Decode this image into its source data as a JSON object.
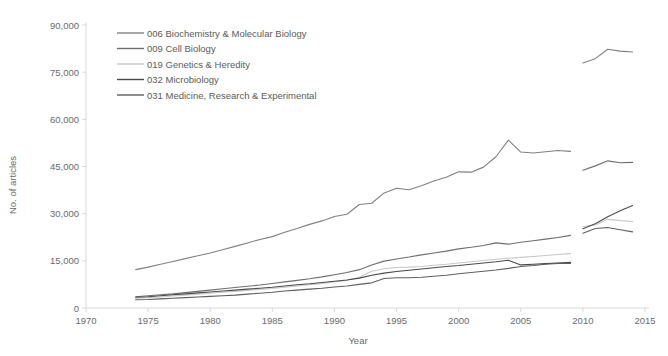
{
  "chart_data": {
    "type": "line",
    "title": "",
    "xlabel": "Year",
    "ylabel": "No. of articles",
    "xlim": [
      1970,
      2015
    ],
    "ylim": [
      0,
      90000
    ],
    "xticks": [
      1970,
      1975,
      1980,
      1985,
      1990,
      1995,
      2000,
      2005,
      2010,
      2015
    ],
    "yticks": [
      0,
      15000,
      30000,
      45000,
      60000,
      75000,
      90000
    ],
    "ytick_labels": [
      "0",
      "15,000",
      "30,000",
      "45,000",
      "60,000",
      "75,000",
      "90,000"
    ],
    "xtick_labels": [
      "1970",
      "1975",
      "1980",
      "1985",
      "1990",
      "1995",
      "2000",
      "2005",
      "2010",
      "2015"
    ],
    "grid": false,
    "legend_position": "top-left",
    "series": [
      {
        "name": "006 Biochemistry & Molecular Biology",
        "color": "#808080",
        "width": 1.1,
        "segments": [
          {
            "x": [
              1974,
              1975,
              1976,
              1977,
              1978,
              1979,
              1980,
              1981,
              1982,
              1983,
              1984,
              1985,
              1986,
              1987,
              1988,
              1989,
              1990,
              1991,
              1992,
              1993,
              1994,
              1995,
              1996,
              1997,
              1998,
              1999,
              2000,
              2001,
              2002,
              2003,
              2004,
              2005,
              2006,
              2007,
              2008,
              2009
            ],
            "y": [
              12200,
              13000,
              13900,
              14800,
              15700,
              16600,
              17500,
              18500,
              19600,
              20700,
              21800,
              22700,
              24100,
              25300,
              26600,
              27700,
              29100,
              29800,
              32900,
              33300,
              36600,
              38100,
              37600,
              38900,
              40400,
              41600,
              43300,
              43200,
              44800,
              48100,
              53400,
              49600,
              49300,
              49700,
              50100,
              49800
            ]
          },
          {
            "x": [
              2010,
              2011,
              2012,
              2013,
              2014
            ],
            "y": [
              77900,
              79300,
              82300,
              81700,
              81400
            ]
          }
        ]
      },
      {
        "name": "009 Cell Biology",
        "color": "#6e6e6e",
        "width": 1.1,
        "segments": [
          {
            "x": [
              1974,
              1975,
              1976,
              1977,
              1978,
              1979,
              1980,
              1981,
              1982,
              1983,
              1984,
              1985,
              1986,
              1987,
              1988,
              1989,
              1990,
              1991,
              1992,
              1993,
              1994,
              1995,
              1996,
              1997,
              1998,
              1999,
              2000,
              2001,
              2002,
              2003,
              2004,
              2005,
              2006,
              2007,
              2008,
              2009
            ],
            "y": [
              3600,
              3900,
              4200,
              4500,
              4900,
              5300,
              5700,
              6100,
              6500,
              6900,
              7300,
              7800,
              8300,
              8800,
              9300,
              9900,
              10600,
              11300,
              12200,
              13700,
              14900,
              15600,
              16200,
              16900,
              17500,
              18100,
              18800,
              19300,
              19900,
              20700,
              20300,
              20900,
              21400,
              21900,
              22400,
              23100
            ]
          },
          {
            "x": [
              2010,
              2011,
              2012,
              2013,
              2014
            ],
            "y": [
              43800,
              45200,
              46800,
              46200,
              46300
            ]
          }
        ]
      },
      {
        "name": "019 Genetics & Heredity",
        "color": "#c8c8c8",
        "width": 1.1,
        "segments": [
          {
            "x": [
              1974,
              1975,
              1976,
              1977,
              1978,
              1979,
              1980,
              1981,
              1982,
              1983,
              1984,
              1985,
              1986,
              1987,
              1988,
              1989,
              1990,
              1991,
              1992,
              1993,
              1994,
              1995,
              1996,
              1997,
              1998,
              1999,
              2000,
              2001,
              2002,
              2003,
              2004,
              2005,
              2006,
              2007,
              2008,
              2009
            ],
            "y": [
              3100,
              3300,
              3500,
              3800,
              4100,
              4400,
              4700,
              5000,
              5300,
              5600,
              5900,
              6200,
              6600,
              7000,
              7400,
              7800,
              8300,
              8800,
              9800,
              11700,
              12500,
              12900,
              13000,
              13200,
              13600,
              13900,
              14300,
              14700,
              15100,
              15500,
              15800,
              16100,
              16400,
              16700,
              17000,
              17300
            ]
          },
          {
            "x": [
              2010,
              2011,
              2012,
              2013,
              2014
            ],
            "y": [
              25900,
              26400,
              28200,
              27800,
              27500
            ]
          }
        ]
      },
      {
        "name": "032 Microbiology",
        "color": "#4a4a4a",
        "width": 1.1,
        "segments": [
          {
            "x": [
              1974,
              1975,
              1976,
              1977,
              1978,
              1979,
              1980,
              1981,
              1982,
              1983,
              1984,
              1985,
              1986,
              1987,
              1988,
              1989,
              1990,
              1991,
              1992,
              1993,
              1994,
              1995,
              1996,
              1997,
              1998,
              1999,
              2000,
              2001,
              2002,
              2003,
              2004,
              2005,
              2006,
              2007,
              2008,
              2009
            ],
            "y": [
              3400,
              3600,
              3900,
              4200,
              4500,
              4800,
              5100,
              5400,
              5700,
              6000,
              6300,
              6600,
              7000,
              7400,
              7700,
              8100,
              8500,
              8900,
              9500,
              10400,
              11100,
              11600,
              12000,
              12400,
              12800,
              13200,
              13500,
              13900,
              14300,
              14700,
              15200,
              13700,
              13900,
              14100,
              14300,
              14500
            ]
          },
          {
            "x": [
              2010,
              2011,
              2012,
              2013,
              2014
            ],
            "y": [
              25200,
              26800,
              29000,
              30900,
              32600
            ]
          }
        ]
      },
      {
        "name": "031 Medicine, Research & Experimental",
        "color": "#5e5e5e",
        "width": 1.1,
        "segments": [
          {
            "x": [
              1974,
              1975,
              1976,
              1977,
              1978,
              1979,
              1980,
              1981,
              1982,
              1983,
              1984,
              1985,
              1986,
              1987,
              1988,
              1989,
              1990,
              1991,
              1992,
              1993,
              1994,
              1995,
              1996,
              1997,
              1998,
              1999,
              2000,
              2001,
              2002,
              2003,
              2004,
              2005,
              2006,
              2007,
              2008,
              2009
            ],
            "y": [
              2600,
              2700,
              2900,
              3100,
              3300,
              3500,
              3700,
              3900,
              4100,
              4400,
              4700,
              5000,
              5400,
              5700,
              6000,
              6300,
              6700,
              7000,
              7500,
              8000,
              9400,
              9600,
              9600,
              9800,
              10100,
              10400,
              10900,
              11300,
              11700,
              12100,
              12600,
              13200,
              13500,
              13900,
              14200,
              14200
            ]
          },
          {
            "x": [
              2010,
              2011,
              2012,
              2013,
              2014
            ],
            "y": [
              23800,
              25300,
              25600,
              24900,
              24200
            ]
          }
        ]
      }
    ]
  },
  "legend": {
    "entries": [
      "006 Biochemistry & Molecular Biology",
      "009 Cell Biology",
      "019 Genetics & Heredity",
      "032 Microbiology",
      "031 Medicine, Research & Experimental"
    ]
  }
}
